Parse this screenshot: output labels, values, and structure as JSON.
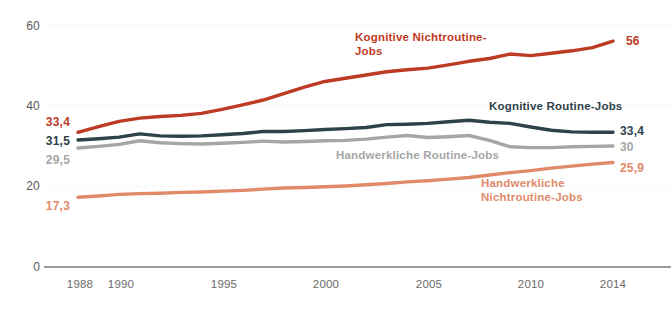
{
  "chart_data": {
    "type": "line",
    "title": "",
    "xlabel": "",
    "ylabel": "",
    "xlim": [
      1988,
      2014
    ],
    "ylim": [
      0,
      60
    ],
    "grid": true,
    "legend_position": "inline-annotations",
    "x_ticks": [
      "1988",
      "1990",
      "1995",
      "2000",
      "2005",
      "2010",
      "2014"
    ],
    "x_tick_values": [
      1988,
      1990,
      1995,
      2000,
      2005,
      2010,
      2014
    ],
    "y_ticks": [
      "0",
      "20",
      "40",
      "60"
    ],
    "y_tick_values": [
      0,
      20,
      40,
      60
    ],
    "x": [
      1988,
      1989,
      1990,
      1991,
      1992,
      1993,
      1994,
      1995,
      1996,
      1997,
      1998,
      1999,
      2000,
      2001,
      2002,
      2003,
      2004,
      2005,
      2006,
      2007,
      2008,
      2009,
      2010,
      2011,
      2012,
      2013,
      2014
    ],
    "series": [
      {
        "name": "Kognitive Nichtroutine-Jobs",
        "color": "#bd3b24",
        "start_label": "33,4",
        "end_label": "56",
        "start_value": 33.4,
        "end_value": 56,
        "values": [
          33.4,
          34.8,
          36.1,
          36.9,
          37.3,
          37.6,
          38.1,
          39.1,
          40.2,
          41.4,
          43.0,
          44.6,
          46.0,
          46.8,
          47.6,
          48.4,
          48.9,
          49.3,
          50.1,
          51.0,
          51.7,
          52.8,
          52.4,
          53.0,
          53.6,
          54.4,
          56.0
        ]
      },
      {
        "name": "Kognitive Routine-Jobs",
        "color": "#2e4249",
        "start_label": "31,5",
        "end_label": "33,4",
        "start_value": 31.5,
        "end_value": 33.4,
        "values": [
          31.5,
          31.8,
          32.2,
          33.0,
          32.5,
          32.4,
          32.5,
          32.8,
          33.1,
          33.6,
          33.6,
          33.8,
          34.1,
          34.3,
          34.6,
          35.3,
          35.4,
          35.6,
          36.0,
          36.4,
          35.9,
          35.6,
          34.7,
          33.9,
          33.5,
          33.4,
          33.4
        ]
      },
      {
        "name": "Handwerkliche Routine-Jobs",
        "color": "#a6a6a6",
        "start_label": "29,5",
        "end_label": "30",
        "start_value": 29.5,
        "end_value": 30,
        "values": [
          29.5,
          29.9,
          30.4,
          31.3,
          30.8,
          30.6,
          30.5,
          30.7,
          30.9,
          31.2,
          31.0,
          31.1,
          31.3,
          31.4,
          31.7,
          32.2,
          32.6,
          32.1,
          32.3,
          32.6,
          31.4,
          29.8,
          29.6,
          29.6,
          29.8,
          29.9,
          30.0
        ]
      },
      {
        "name": "Handwerkliche Nichtroutine-Jobs",
        "color": "#e08a6a",
        "start_label": "17,3",
        "end_label": "25,9",
        "start_value": 17.3,
        "end_value": 25.9,
        "values": [
          17.3,
          17.6,
          18.0,
          18.2,
          18.3,
          18.5,
          18.6,
          18.8,
          19.0,
          19.3,
          19.6,
          19.7,
          19.9,
          20.1,
          20.4,
          20.7,
          21.1,
          21.4,
          21.8,
          22.2,
          22.8,
          23.4,
          23.9,
          24.5,
          25.0,
          25.5,
          25.9
        ]
      }
    ],
    "annotations": [
      {
        "text": "Kognitive\nNichtroutine-Jobs",
        "color": "#bd3b24"
      },
      {
        "text": "Kognitive Routine-Jobs",
        "color": "#2e4249"
      },
      {
        "text": "Handwerkliche Routine-Jobs",
        "color": "#a6a6a6"
      },
      {
        "text": "Handwerkliche\nNichtroutine-Jobs",
        "color": "#e08a6a"
      }
    ]
  }
}
